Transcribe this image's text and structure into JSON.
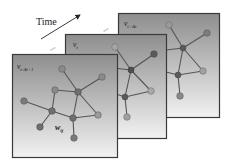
{
  "diagram": {
    "time_label": "Time",
    "ellipsis": "...",
    "colors": {
      "frame_top": "#8e8e8e",
      "frame_bottom": "#f2f2f2",
      "frame_border": "#3a3a3a",
      "edge": "#555555",
      "node_light": "#9a9a9a",
      "node_dark": "#5a5a5a"
    },
    "frames": [
      {
        "id": "back",
        "label_main": "v",
        "label_sub": "t+Δt",
        "x": 118,
        "y": 13,
        "w": 101,
        "h": 104
      },
      {
        "id": "middle",
        "label_main": "v",
        "label_sub": "t",
        "x": 65,
        "y": 34,
        "w": 101,
        "h": 104
      },
      {
        "id": "front",
        "label_main": "v",
        "label_sub": "t-Δt+1",
        "x": 12,
        "y": 54,
        "w": 105,
        "h": 103,
        "edge_weight_label_main": "w",
        "edge_weight_label_sub": "ij"
      }
    ]
  }
}
